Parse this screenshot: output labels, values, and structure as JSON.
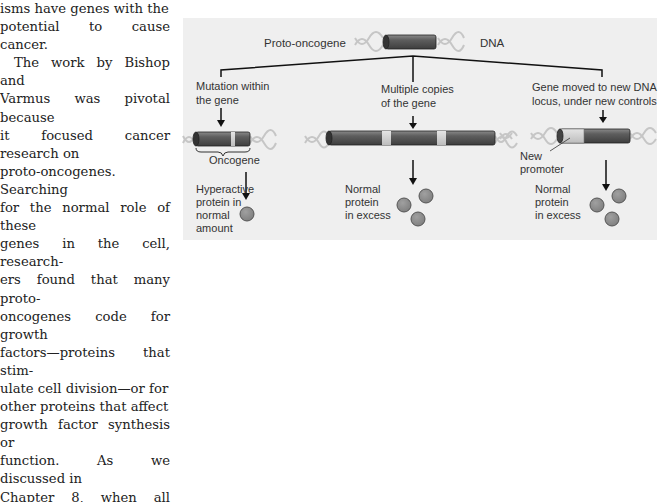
{
  "body_text": {
    "lines": [
      "isms have genes with the",
      "potential to cause cancer.",
      "The work by Bishop and",
      "Varmus was pivotal because",
      "it focused cancer research on",
      "proto-oncogenes. Searching",
      "for the normal role of these",
      "genes in the cell, research-",
      "ers found that many proto-",
      "oncogenes code for growth",
      "factors—proteins that stim-",
      "ulate cell division—or for",
      "other proteins that affect",
      "growth factor synthesis or",
      "function. As we discussed in",
      "Chapter 8, when all these"
    ]
  },
  "figure": {
    "top_label": "Proto-oncogene",
    "dna_label": "DNA",
    "branches": [
      {
        "title": "Mutation within\nthe gene",
        "gene_label": "Oncogene",
        "result": "Hyperactive\nprotein in\nnormal\namount",
        "protein_count": 1
      },
      {
        "title": "Multiple copies\nof the gene",
        "result": "Normal\nprotein\nin excess",
        "protein_count": 3
      },
      {
        "title": "Gene moved to new DNA\nlocus, under new controls",
        "callout": "New\npromoter",
        "result": "Normal\nprotein\nin excess",
        "protein_count": 3
      }
    ],
    "colors": {
      "panel_bg": "#efefef",
      "gene_dark": "#5a5a5a",
      "gene_light": "#cfcfcf",
      "protein": "#8c8c8c",
      "helix": "#c4c4c4"
    }
  }
}
